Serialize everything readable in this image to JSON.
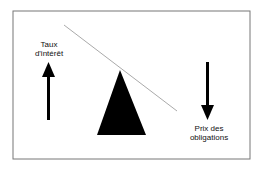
{
  "diagram": {
    "left_label_line1": "Taux",
    "left_label_line2": "d'intérêt",
    "right_label_line1": "Prix des",
    "right_label_line2": "obligations",
    "colors": {
      "border": "#777777",
      "beam": "#aaaaaa",
      "shape": "#000000"
    }
  }
}
